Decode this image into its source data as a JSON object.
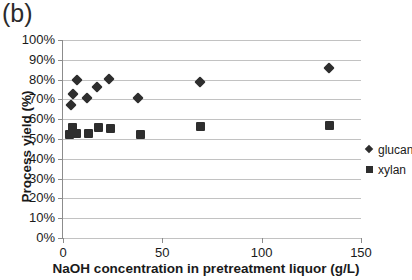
{
  "panel_label": "(b)",
  "chart_data": {
    "type": "scatter",
    "title": "",
    "panel": "(b)",
    "xlabel": "NaOH concentration in pretreatment liquor (g/L)",
    "ylabel": "Process yield (%)",
    "xlim": [
      0,
      150
    ],
    "ylim": [
      0,
      100
    ],
    "xticks": [
      0,
      50,
      100,
      150
    ],
    "xtick_labels": [
      "0",
      "50",
      "100",
      "150"
    ],
    "yticks": [
      0,
      10,
      20,
      30,
      40,
      50,
      60,
      70,
      80,
      90,
      100
    ],
    "ytick_labels": [
      "0%",
      "10%",
      "20%",
      "30%",
      "40%",
      "50%",
      "60%",
      "70%",
      "80%",
      "90%",
      "100%"
    ],
    "grid": "horizontal",
    "legend_position": "right",
    "marker_color": "#2e2e2e",
    "series": [
      {
        "name": "glucan",
        "marker": "diamond",
        "color": "#2e2e2e",
        "points": [
          {
            "x": 4,
            "y": 67
          },
          {
            "x": 5,
            "y": 72.5
          },
          {
            "x": 7,
            "y": 80
          },
          {
            "x": 12,
            "y": 70.5
          },
          {
            "x": 17,
            "y": 76.5
          },
          {
            "x": 23,
            "y": 80.5
          },
          {
            "x": 38,
            "y": 70.5
          },
          {
            "x": 69,
            "y": 79
          },
          {
            "x": 134,
            "y": 86
          }
        ]
      },
      {
        "name": "xylan",
        "marker": "square",
        "color": "#2e2e2e",
        "points": [
          {
            "x": 3.5,
            "y": 52.5
          },
          {
            "x": 5,
            "y": 56
          },
          {
            "x": 7,
            "y": 53
          },
          {
            "x": 13,
            "y": 53
          },
          {
            "x": 18,
            "y": 56
          },
          {
            "x": 24,
            "y": 55.5
          },
          {
            "x": 39,
            "y": 52.5
          },
          {
            "x": 69,
            "y": 56.5
          },
          {
            "x": 134,
            "y": 57
          }
        ]
      }
    ]
  },
  "legend": [
    {
      "label": "glucan",
      "marker": "diamond"
    },
    {
      "label": "xylan",
      "marker": "square"
    }
  ]
}
